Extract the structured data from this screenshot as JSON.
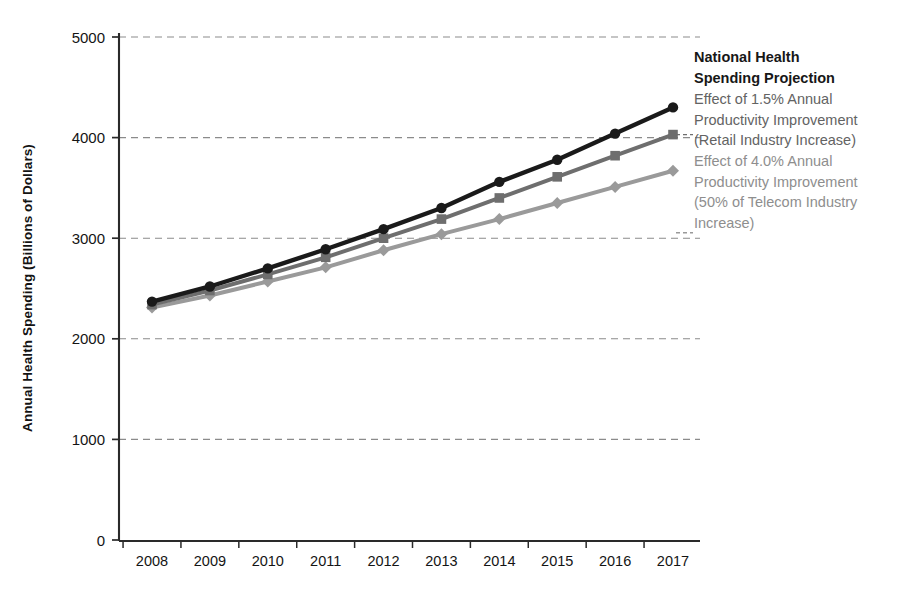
{
  "chart_data": {
    "type": "line",
    "title": "",
    "xlabel": "",
    "ylabel": "Annual Health Spending (Billions of Dollars)",
    "categories": [
      2008,
      2009,
      2010,
      2011,
      2012,
      2013,
      2014,
      2015,
      2016,
      2017
    ],
    "xtick_labels": [
      "2008",
      "2009",
      "2010",
      "2011",
      "2012",
      "2013",
      "2014",
      "2015",
      "2016",
      "2017"
    ],
    "ytick_labels": [
      "0",
      "1000",
      "2000",
      "3000",
      "4000",
      "5000"
    ],
    "yticks": [
      0,
      1000,
      2000,
      3000,
      4000,
      5000
    ],
    "ylim": [
      0,
      5000
    ],
    "grid": true,
    "grid_style": "dashed-horizontal",
    "legend_position": "right-inline-at-line-ends",
    "series": [
      {
        "name": "National Health Spending Projection",
        "marker": "circle",
        "color": "#1a1a1a",
        "values": [
          2370,
          2520,
          2700,
          2890,
          3090,
          3300,
          3560,
          3780,
          4040,
          4300
        ]
      },
      {
        "name": "Effect of 1.5% Annual Productivity Improvement (Retail Industry Increase)",
        "marker": "square",
        "color": "#6e6e6e",
        "values": [
          2340,
          2480,
          2640,
          2810,
          3000,
          3190,
          3400,
          3610,
          3820,
          4030
        ]
      },
      {
        "name": "Effect of 4.0% Annual Productivity Improvement (50% of Telecom Industry Increase)",
        "marker": "diamond",
        "color": "#9a9a9a",
        "values": [
          2310,
          2430,
          2570,
          2710,
          2880,
          3040,
          3190,
          3350,
          3510,
          3670
        ]
      }
    ]
  },
  "legend": {
    "entries": [
      {
        "id": "national-health-spending-projection",
        "lines": [
          "National Health",
          "Spending Projection"
        ],
        "color": "#171717",
        "bold": true,
        "marker": "none"
      },
      {
        "id": "effect-1-5-percent",
        "lines": [
          "Effect of 1.5% Annual",
          "Productivity Improvement",
          "(Retail Industry Increase)"
        ],
        "color": "#636363",
        "bold": false,
        "marker": "square"
      },
      {
        "id": "effect-4-0-percent",
        "lines": [
          "Effect of 4.0% Annual",
          "Productivity Improvement",
          "(50% of Telecom Industry",
          "Increase)"
        ],
        "color": "#8e8e8e",
        "bold": false,
        "marker": "diamond"
      }
    ]
  },
  "axis": {
    "y_title": "Annual Health Spending (Billions of Dollars)",
    "y_labels": [
      "5000",
      "4000",
      "3000",
      "2000",
      "1000",
      "0"
    ],
    "x_labels": [
      "2008",
      "2009",
      "2010",
      "2011",
      "2012",
      "2013",
      "2014",
      "2015",
      "2016",
      "2017"
    ]
  },
  "colors": {
    "series_1": "#1a1a1a",
    "series_2": "#6e6e6e",
    "series_3": "#9a9a9a",
    "axis": "#2a2a2a",
    "grid": "#8b8b8b",
    "background": "#ffffff"
  }
}
